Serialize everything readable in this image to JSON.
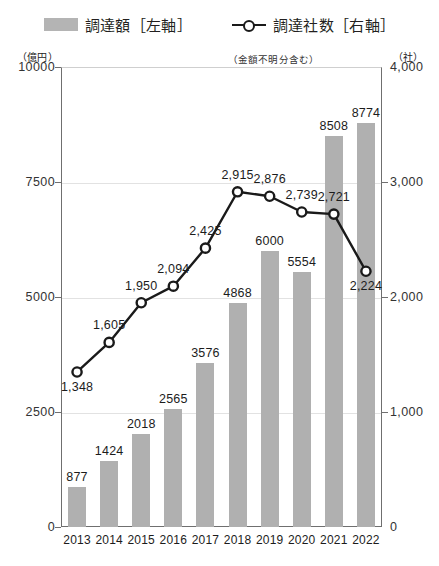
{
  "legend": {
    "bar_label": "調達額［左軸］",
    "line_label": "調達社数［右軸］",
    "line_sublabel": "（金額不明分含む）"
  },
  "axes": {
    "left_unit": "（億円）",
    "right_unit": "（社）",
    "left_ticks": [
      "10000",
      "7500",
      "5000",
      "2500",
      "0"
    ],
    "right_ticks": [
      "4,000",
      "3,000",
      "2,000",
      "1,000",
      "0"
    ]
  },
  "chart_data": {
    "type": "bar",
    "title": "",
    "subtitle": "",
    "xlabel": "",
    "ylabel": "（億円）",
    "y2label": "（社）",
    "ylim": [
      0,
      10000
    ],
    "y2lim": [
      0,
      4000
    ],
    "yticks": [
      0,
      2500,
      5000,
      7500,
      10000
    ],
    "y2ticks": [
      0,
      1000,
      2000,
      3000,
      4000
    ],
    "grid": true,
    "legend_position": "top-center",
    "categories": [
      "2013",
      "2014",
      "2015",
      "2016",
      "2017",
      "2018",
      "2019",
      "2020",
      "2021",
      "2022"
    ],
    "series": [
      {
        "name": "調達額［左軸］",
        "type": "bar",
        "axis": "left",
        "unit": "億円",
        "color": "#b0b0b0",
        "values": [
          877,
          1424,
          2018,
          2565,
          3576,
          4868,
          6000,
          5554,
          8508,
          8774
        ],
        "labels": [
          "877",
          "1424",
          "2018",
          "2565",
          "3576",
          "4868",
          "6000",
          "5554",
          "8508",
          "8774"
        ]
      },
      {
        "name": "調達社数［右軸］",
        "type": "line",
        "axis": "right",
        "unit": "社",
        "color": "#1a1a1a",
        "marker": "circle-open",
        "values": [
          1348,
          1605,
          1950,
          2094,
          2425,
          2915,
          2876,
          2739,
          2721,
          2224
        ],
        "labels": [
          "1,348",
          "1,605",
          "1,950",
          "2,094",
          "2,425",
          "2,915",
          "2,876",
          "2,739",
          "2,721",
          "2,224"
        ]
      }
    ]
  }
}
